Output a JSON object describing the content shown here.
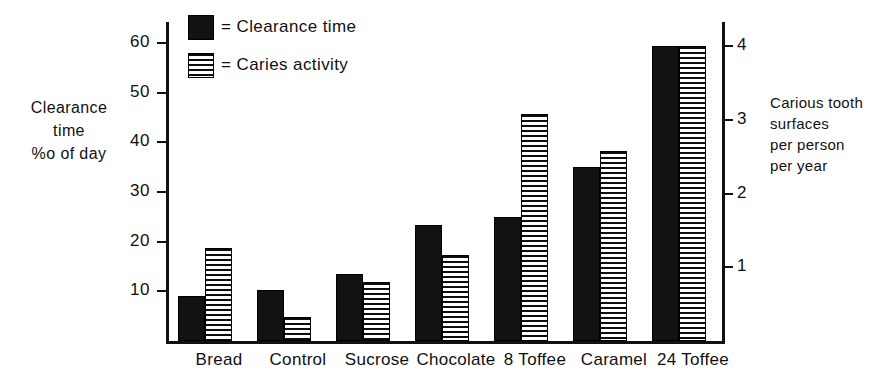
{
  "chart_data": {
    "type": "bar",
    "title": "",
    "categories": [
      "Bread",
      "Control",
      "Sucrose",
      "Chocolate",
      "8 Toffee",
      "Caramel",
      "24 Toffee"
    ],
    "series": [
      {
        "name": "Clearance time",
        "swatch": "solid-black",
        "axis": "left",
        "values": [
          9,
          10.3,
          13.5,
          23.4,
          24.9,
          35,
          59.3
        ]
      },
      {
        "name": "Caries activity",
        "swatch": "horizontal-hatch",
        "axis": "right",
        "values_left_scale": [
          18.7,
          4.8,
          11.9,
          17.4,
          45.7,
          38.2,
          59.3
        ],
        "values": [
          1.26,
          0.32,
          0.8,
          1.17,
          3.08,
          2.57,
          4.0
        ]
      }
    ],
    "left_axis": {
      "label_lines": [
        "Clearance",
        "time",
        "%o of day"
      ],
      "ticks": [
        10,
        20,
        30,
        40,
        50,
        60
      ],
      "ylim": [
        0,
        64
      ],
      "tick_labels": [
        "10",
        "20",
        "30",
        "40",
        "50",
        "60"
      ]
    },
    "right_axis": {
      "label_lines": [
        "Carious tooth",
        "surfaces",
        "per person",
        "per year"
      ],
      "ticks": [
        1,
        2,
        3,
        4
      ],
      "ylim": [
        0,
        4.32
      ],
      "tick_labels": [
        "1",
        "2",
        "3",
        "4"
      ]
    },
    "legend": {
      "position": "top-left-inside",
      "entries": [
        {
          "marker": "solid-black",
          "text": "= Clearance time"
        },
        {
          "marker": "horizontal-hatch",
          "text": "= Caries activity"
        }
      ]
    },
    "grid": false,
    "colors": {
      "clearance_time": "#121212",
      "caries_activity": "#0d0d0d",
      "axis": "#111111",
      "background": "#ffffff"
    }
  }
}
